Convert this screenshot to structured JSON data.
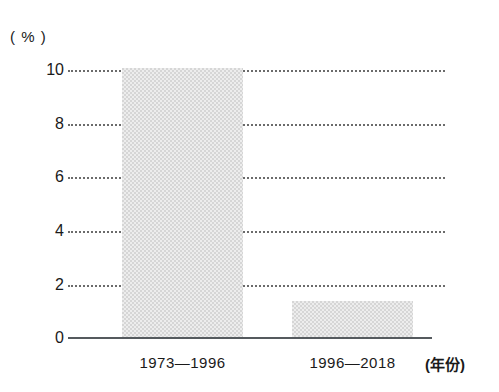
{
  "chart_data": {
    "type": "bar",
    "title": "",
    "subtitle": "",
    "xlabel": "(年份)",
    "ylabel": "( % )",
    "categories": [
      "1973—1996",
      "1996—2018"
    ],
    "values": [
      10.2,
      1.4
    ],
    "series": [
      {
        "name": "",
        "values": [
          10.2,
          1.4
        ]
      }
    ],
    "ylim": [
      0,
      10.5
    ],
    "yticks": [
      0,
      2,
      4,
      6,
      8,
      10
    ],
    "ytick_labels": [
      "0",
      "2",
      "4",
      "6",
      "8",
      "10"
    ],
    "grid": "horizontal-dotted",
    "legend": "none",
    "bar_color": "#d6d6d6",
    "axis_color": "#555a5e",
    "grid_color": "#6b6b6b",
    "text_color": "#1a1a1a",
    "annotations": []
  },
  "axes": {
    "y_unit_label": "( % )",
    "x_unit_label": "(年份)",
    "ticks": [
      {
        "label": "10",
        "value": 10
      },
      {
        "label": "8",
        "value": 8
      },
      {
        "label": "6",
        "value": 6
      },
      {
        "label": "4",
        "value": 4
      },
      {
        "label": "2",
        "value": 2
      },
      {
        "label": "0",
        "value": 0
      }
    ]
  },
  "bars": [
    {
      "label": "1973—1996",
      "value": 10.2
    },
    {
      "label": "1996—2018",
      "value": 1.4
    }
  ]
}
